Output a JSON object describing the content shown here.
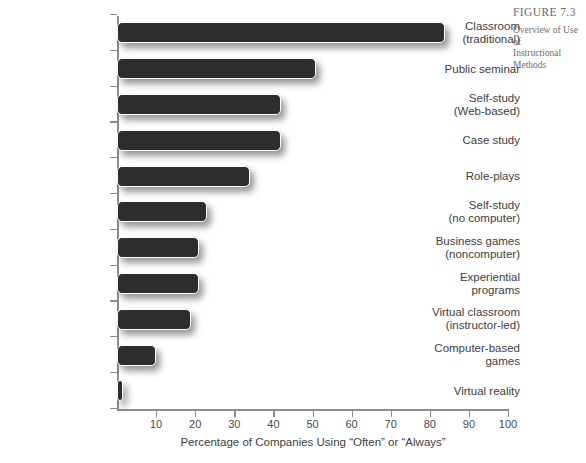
{
  "caption": {
    "figure_label": "FIGURE 7.3",
    "line1": "Overview of Use of",
    "line2": "Instructional Methods"
  },
  "source_note": "",
  "axis": {
    "x_tick_labels": [
      "10",
      "20",
      "30",
      "40",
      "50",
      "60",
      "70",
      "80",
      "90",
      "100"
    ],
    "x_title": "Percentage of Companies Using “Often” or “Always”"
  },
  "chart_data": {
    "type": "bar",
    "orientation": "horizontal",
    "title": "Overview of Use of Instructional Methods",
    "xlabel": "Percentage of Companies Using “Often” or “Always”",
    "ylabel": "",
    "xlim": [
      0,
      100
    ],
    "xticks": [
      0,
      10,
      20,
      30,
      40,
      50,
      60,
      70,
      80,
      90,
      100
    ],
    "grid": false,
    "legend": false,
    "bar_color": "#2e2c2d",
    "categories": [
      "Classroom (traditional)",
      "Public seminar",
      "Self-study (Web-based)",
      "Case study",
      "Role-plays",
      "Self-study (no computer)",
      "Business games (noncomputer)",
      "Experiential programs",
      "Virtual classroom (instructor-led)",
      "Computer-based games",
      "Virtual reality"
    ],
    "values": [
      84,
      51,
      42,
      42,
      34,
      23,
      21,
      21,
      19,
      10,
      1.5
    ]
  },
  "categories": [
    {
      "line1": "Classroom",
      "line2": "(traditional)",
      "value": 84
    },
    {
      "line1": "Public seminar",
      "line2": "",
      "value": 51
    },
    {
      "line1": "Self-study",
      "line2": "(Web-based)",
      "value": 42
    },
    {
      "line1": "Case study",
      "line2": "",
      "value": 42
    },
    {
      "line1": "Role-plays",
      "line2": "",
      "value": 34
    },
    {
      "line1": "Self-study",
      "line2": "(no computer)",
      "value": 23
    },
    {
      "line1": "Business games",
      "line2": "(noncomputer)",
      "value": 21
    },
    {
      "line1": "Experiential",
      "line2": "programs",
      "value": 21
    },
    {
      "line1": "Virtual classroom",
      "line2": "(instructor-led)",
      "value": 19
    },
    {
      "line1": "Computer-based",
      "line2": "games",
      "value": 10
    },
    {
      "line1": "Virtual reality",
      "line2": "",
      "value": 1.5
    }
  ]
}
